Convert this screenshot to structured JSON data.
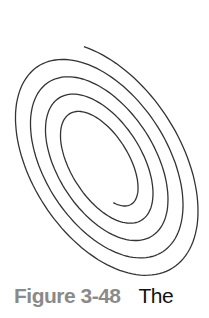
{
  "figure": {
    "type": "elliptical-spiral",
    "turns": 4.5,
    "stroke_color": "#333333",
    "caption_label": "Figure 3-48",
    "caption_text": "The"
  }
}
